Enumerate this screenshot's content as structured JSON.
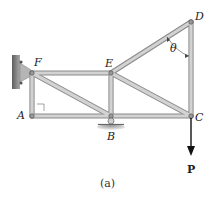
{
  "figure": {
    "caption": "(a)",
    "joints": {
      "A": {
        "label": "A"
      },
      "B": {
        "label": "B"
      },
      "C": {
        "label": "C"
      },
      "D": {
        "label": "D"
      },
      "E": {
        "label": "E"
      },
      "F": {
        "label": "F"
      }
    },
    "angle_label": "θ",
    "load_label": "P",
    "members": [
      "AF",
      "AB",
      "BC",
      "FE",
      "EB",
      "FB",
      "ED",
      "EC",
      "DC"
    ],
    "supports": {
      "wall": "pin support at F (wall bracket)",
      "roller": "roller support at B"
    },
    "colors": {
      "member_fill": "#c8c8c8",
      "member_edge": "#8a8a8a",
      "wall": "#7a7a7a",
      "arrow": "#111111"
    }
  }
}
